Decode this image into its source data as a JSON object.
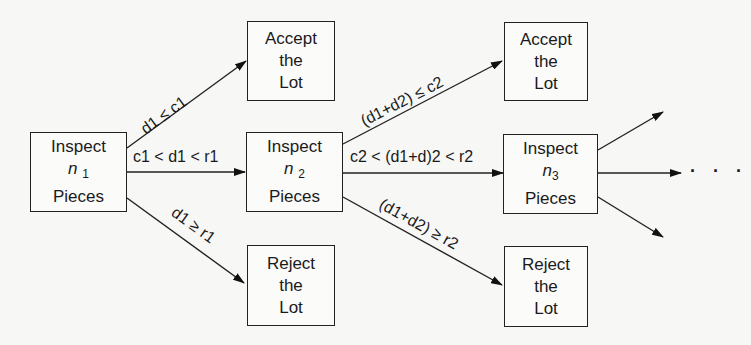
{
  "diagram": {
    "type": "flowchart",
    "title": "",
    "nodes": {
      "inspect1": {
        "line1": "Inspect",
        "var": "n",
        "sub": "1",
        "line3": "Pieces"
      },
      "accept1": {
        "line1": "Accept",
        "line2": "the",
        "line3": "Lot"
      },
      "reject1": {
        "line1": "Reject",
        "line2": "the",
        "line3": "Lot"
      },
      "inspect2": {
        "line1": "Inspect",
        "var": "n",
        "sub": "2",
        "line3": "Pieces"
      },
      "accept2": {
        "line1": "Accept",
        "line2": "the",
        "line3": "Lot"
      },
      "reject2": {
        "line1": "Reject",
        "line2": "the",
        "line3": "Lot"
      },
      "inspect3": {
        "line1": "Inspect",
        "var": "n",
        "sub": "3",
        "line3": "Pieces"
      }
    },
    "edges": [
      {
        "from": "inspect1",
        "to": "accept1",
        "label": "d1 ≤ c1"
      },
      {
        "from": "inspect1",
        "to": "inspect2",
        "label": "c1 < d1 < r1"
      },
      {
        "from": "inspect1",
        "to": "reject1",
        "label": "d1 ≥ r1"
      },
      {
        "from": "inspect2",
        "to": "accept2",
        "label": "(d1+d2) ≤ c2"
      },
      {
        "from": "inspect2",
        "to": "inspect3",
        "label": "c2 < (d1+d)2 < r2"
      },
      {
        "from": "inspect2",
        "to": "reject2",
        "label": "(d1+d2) ≥ r2"
      },
      {
        "from": "inspect3",
        "to": "continuation-up",
        "label": ""
      },
      {
        "from": "inspect3",
        "to": "continuation-mid",
        "label": ""
      },
      {
        "from": "inspect3",
        "to": "continuation-down",
        "label": ""
      }
    ],
    "continuation": "· · ·"
  }
}
